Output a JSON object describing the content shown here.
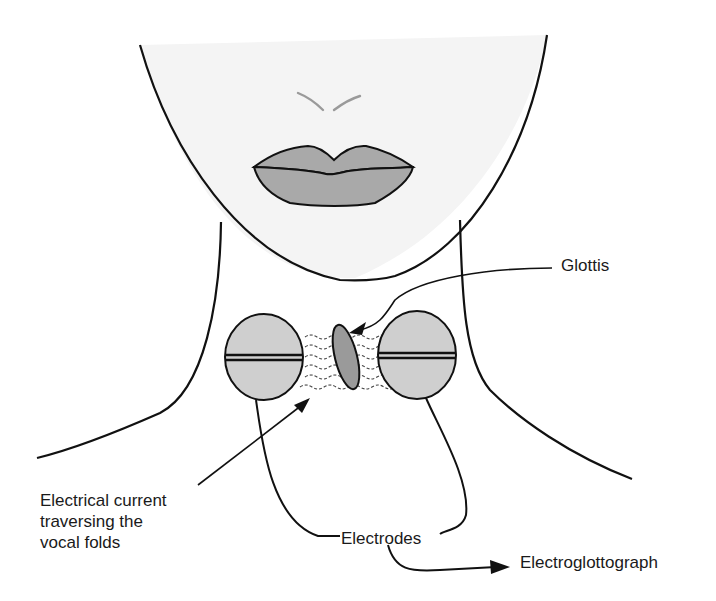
{
  "diagram": {
    "labels": {
      "glottis": "Glottis",
      "current": "Electrical current\ntraversing the\nvocal folds",
      "electrodes": "Electrodes",
      "electroglottograph": "Electroglottograph"
    },
    "parts": [
      "face",
      "nose",
      "lips",
      "neck",
      "left-electrode",
      "right-electrode",
      "glottis",
      "current-waves",
      "electrode-leads"
    ],
    "colors": {
      "face_fill": "#f4f4f4",
      "lip_fill": "#a9a9a9",
      "electrode_fill": "#cfcfcf",
      "glottis_fill": "#9a9a9a",
      "nose_stroke": "#9a9a9a",
      "line": "#111111"
    }
  }
}
